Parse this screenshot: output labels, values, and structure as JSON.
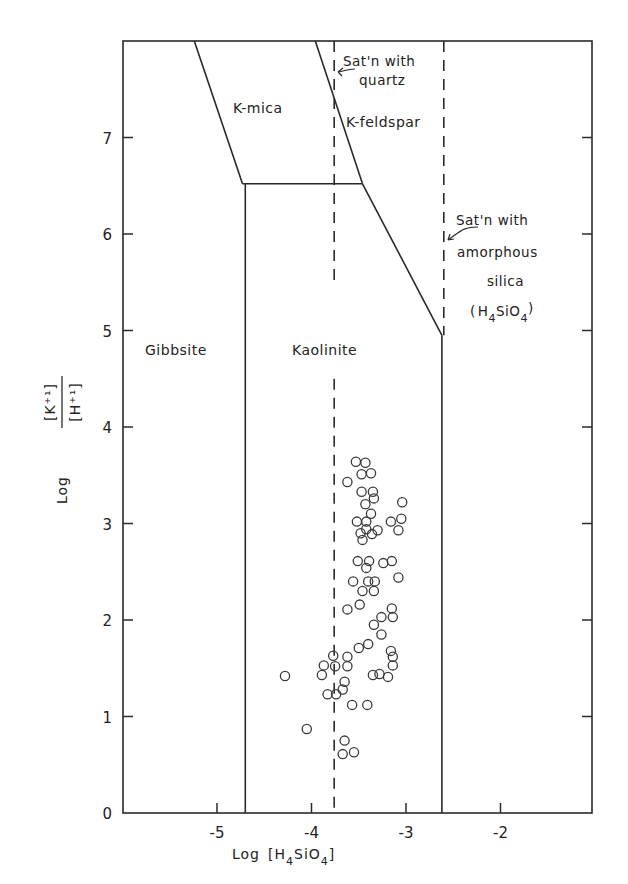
{
  "chart_data": {
    "type": "scatter",
    "title": "",
    "xlabel": "Log [H4SiO4]",
    "ylabel": "Log [K+] / [H+]",
    "xlim": [
      -6,
      -1
    ],
    "ylim": [
      0,
      8
    ],
    "x_ticks": [
      -5,
      -4,
      -3,
      -2
    ],
    "x_tick_labels": [
      "-5",
      "-4",
      "-3",
      "-2"
    ],
    "y_ticks": [
      0,
      1,
      2,
      3,
      4,
      5,
      6,
      7
    ],
    "y_tick_labels": [
      "0",
      "1",
      "2",
      "3",
      "4",
      "5",
      "6",
      "7"
    ],
    "grid": false,
    "legend": null,
    "regions": [
      {
        "name": "Gibbsite",
        "label_at": [
          -5.45,
          4.85
        ]
      },
      {
        "name": "Kaolinite",
        "label_at": [
          -3.85,
          4.85
        ]
      },
      {
        "name": "K-mica",
        "label_at": [
          -4.4,
          7.45
        ]
      },
      {
        "name": "K-feldspar",
        "label_at": [
          -3.25,
          7.45
        ]
      }
    ],
    "boundaries": [
      {
        "between": "Gibbsite / K-mica",
        "points": [
          [
            -5.24,
            8.0
          ],
          [
            -4.73,
            6.52
          ]
        ]
      },
      {
        "between": "Gibbsite / Kaolinite",
        "points": [
          [
            -4.7,
            6.52
          ],
          [
            -4.7,
            0
          ]
        ]
      },
      {
        "between": "K-mica / Kaolinite",
        "points": [
          [
            -4.73,
            6.52
          ],
          [
            -3.46,
            6.52
          ]
        ]
      },
      {
        "between": "K-mica / K-feldspar",
        "points": [
          [
            -3.96,
            8.0
          ],
          [
            -3.46,
            6.52
          ]
        ]
      },
      {
        "between": "Kaolinite / K-feldspar",
        "points": [
          [
            -3.46,
            6.52
          ],
          [
            -2.62,
            4.95
          ]
        ]
      },
      {
        "between": "Kaolinite / right field",
        "points": [
          [
            -2.62,
            4.95
          ],
          [
            -2.62,
            0
          ]
        ]
      }
    ],
    "reference_lines": [
      {
        "label": "Sat'n with quartz",
        "x": -3.76,
        "style": "dashed",
        "segments": [
          [
            8.0,
            5.47
          ],
          [
            4.5,
            0
          ]
        ]
      },
      {
        "label": "Sat'n with amorphous silica (H4SiO4)",
        "x": -2.6,
        "style": "dashed",
        "segments": [
          [
            8.0,
            4.95
          ]
        ]
      }
    ],
    "annotations": [
      {
        "text": "Sat'n with",
        "line2": "quartz"
      },
      {
        "text": "Sat'n with",
        "line2": "amorphous",
        "line3": "silica",
        "line4": "(H4SiO4)"
      }
    ],
    "series": [
      {
        "name": "samples",
        "marker": "open-circle",
        "x": [
          -3.53,
          -3.43,
          -3.47,
          -3.37,
          -3.62,
          -3.47,
          -3.35,
          -3.34,
          -3.04,
          -3.43,
          -3.37,
          -3.52,
          -3.42,
          -3.16,
          -3.05,
          -3.42,
          -3.3,
          -3.48,
          -3.36,
          -3.08,
          -3.46,
          -3.51,
          -3.39,
          -3.24,
          -3.15,
          -3.42,
          -3.56,
          -3.4,
          -3.33,
          -3.08,
          -3.46,
          -3.34,
          -3.49,
          -3.62,
          -3.15,
          -3.26,
          -3.14,
          -3.34,
          -3.26,
          -3.5,
          -3.4,
          -3.16,
          -3.14,
          -3.14,
          -3.77,
          -3.62,
          -3.87,
          -3.75,
          -3.62,
          -4.28,
          -3.89,
          -3.35,
          -3.28,
          -3.19,
          -3.65,
          -3.67,
          -3.83,
          -3.74,
          -3.57,
          -3.41,
          -4.05,
          -3.65,
          -3.67,
          -3.55
        ],
        "y": [
          3.64,
          3.63,
          3.51,
          3.52,
          3.43,
          3.33,
          3.33,
          3.26,
          3.22,
          3.2,
          3.1,
          3.02,
          3.02,
          3.02,
          3.05,
          2.94,
          2.93,
          2.9,
          2.89,
          2.93,
          2.83,
          2.61,
          2.61,
          2.59,
          2.61,
          2.54,
          2.4,
          2.4,
          2.4,
          2.44,
          2.3,
          2.3,
          2.16,
          2.11,
          2.12,
          2.03,
          2.03,
          1.95,
          1.85,
          1.71,
          1.75,
          1.68,
          1.62,
          1.53,
          1.63,
          1.62,
          1.53,
          1.52,
          1.52,
          1.42,
          1.43,
          1.43,
          1.44,
          1.41,
          1.36,
          1.28,
          1.23,
          1.23,
          1.12,
          1.12,
          0.87,
          0.75,
          0.61,
          0.63
        ]
      }
    ]
  },
  "labels": {
    "gibbsite": "Gibbsite",
    "kaolinite": "Kaolinite",
    "kmica": "K-mica",
    "kfeldspar": "K-feldspar",
    "quartz_line1": "Sat'n with",
    "quartz_line2": "quartz",
    "amorph_line1": "Sat'n with",
    "amorph_line2": "amorphous",
    "amorph_line3": "silica",
    "amorph_paren_open": "(",
    "amorph_H": "H",
    "amorph_sub1": "4",
    "amorph_SiO": "SiO",
    "amorph_sub2": "4",
    "amorph_paren_close": ")",
    "xaxis_log": "Log",
    "xaxis_bracket_open": "[H",
    "xaxis_sub1": "4",
    "xaxis_SiO": "SiO",
    "xaxis_sub2": "4",
    "xaxis_bracket_close": "]",
    "yaxis_log": "Log",
    "yaxis_num": "[K⁺¹]",
    "yaxis_den": "[H⁺¹]"
  }
}
